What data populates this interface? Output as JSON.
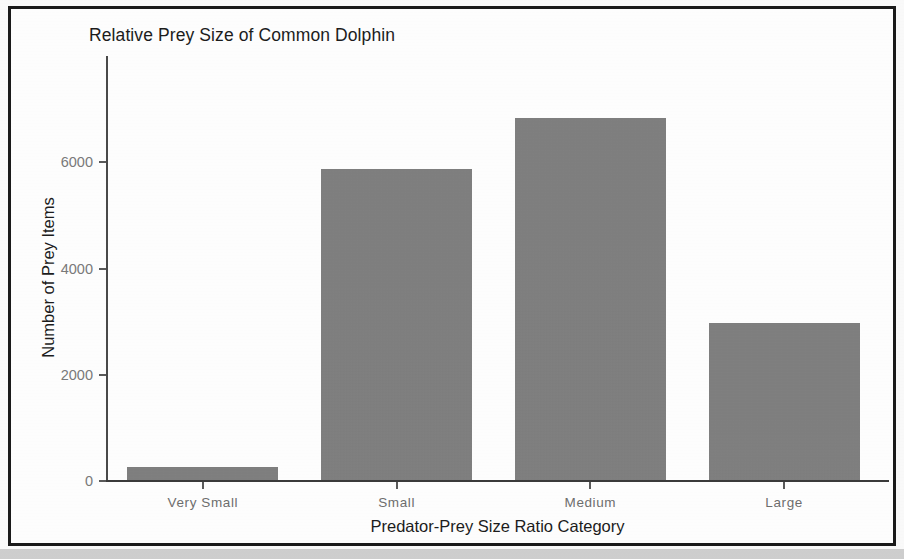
{
  "figure": {
    "title": "Relative Prey Size of Common Dolphin"
  },
  "chart_data": {
    "type": "bar",
    "title": "Relative Prey Size of Common Dolphin",
    "xlabel": "Predator-Prey Size Ratio Category",
    "ylabel": "Number of Prey Items",
    "categories": [
      "Very Small",
      "Small",
      "Medium",
      "Large"
    ],
    "values": [
      260,
      5880,
      6830,
      2980
    ],
    "ytick_labels": [
      "0",
      "2000",
      "4000",
      "6000"
    ],
    "ytick_values": [
      0,
      2000,
      4000,
      6000
    ],
    "ylim": [
      0,
      8000
    ],
    "grid": false,
    "legend": "none",
    "bar_color": "#808080",
    "panel_background": "#ffffff",
    "axis_color": "#4a4a4a",
    "tick_label_color": "#7a7a7a",
    "title_color": "#1c1c1c"
  }
}
